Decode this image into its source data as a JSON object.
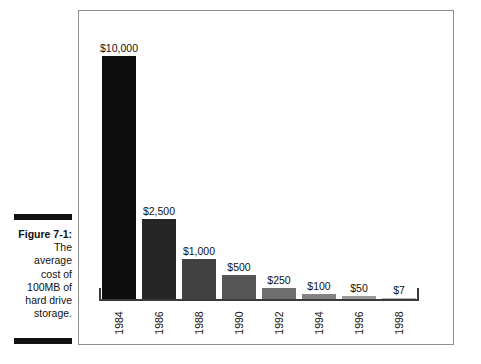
{
  "caption": {
    "label": "Figure 7-1:",
    "lines": [
      "The",
      "average",
      "cost of",
      "100MB of",
      "hard drive",
      "storage."
    ],
    "full_text": "Figure 7-1: The average cost of 100MB of hard drive storage."
  },
  "colors": {
    "frame_border": "#8d8d8d",
    "axis": "#3a3a3a",
    "text": "#111111",
    "background": "#ffffff",
    "rule": "#111111"
  },
  "chart_data": {
    "type": "bar",
    "title": "",
    "subtitle": "",
    "xlabel": "",
    "ylabel": "",
    "grid": false,
    "legend": null,
    "axis_style": "bracket-baseline-only",
    "categories": [
      "1984",
      "1986",
      "1988",
      "1990",
      "1992",
      "1994",
      "1996",
      "1998"
    ],
    "values": [
      10000,
      2500,
      1000,
      500,
      250,
      100,
      50,
      7
    ],
    "value_labels": [
      "$10,000",
      "$2,500",
      "$1,000",
      "$500",
      "$250",
      "$100",
      "$50",
      "$7"
    ],
    "bar_fills": [
      "#0d0d0d",
      "#262626",
      "#414141",
      "#565656",
      "#6e6e6e",
      "#838383",
      "#9a9a9a",
      "#b0b0b0"
    ],
    "bar_pixel_heights": [
      243,
      80,
      40,
      24,
      11,
      5,
      3,
      1
    ],
    "ylim": [
      0,
      10000
    ],
    "units": "US dollars",
    "series_name": "Average cost of 100MB of hard drive storage"
  }
}
